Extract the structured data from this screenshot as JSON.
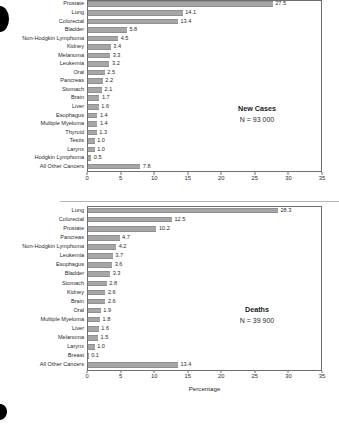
{
  "page": {
    "background_color": "#ffffff",
    "bar_color": "#a6a6a6",
    "axis_color": "#6f6f6f",
    "text_color": "#231f20"
  },
  "chart_data": [
    {
      "id": "new-cases",
      "type": "bar",
      "orientation": "horizontal",
      "title": "",
      "xlabel": "",
      "ylabel": "",
      "xlim": [
        0,
        35
      ],
      "ticks": [
        0,
        5,
        10,
        15,
        20,
        25,
        30,
        35
      ],
      "grid": false,
      "legend": "none",
      "annotation": {
        "title": "New Cases",
        "subtitle": "N = 93 000"
      },
      "categories": [
        "Prostate",
        "Lung",
        "Colorectal",
        "Bladder",
        "Non-Hodgkin Lymphoma",
        "Kidney",
        "Melanoma",
        "Leukemia",
        "Oral",
        "Pancreas",
        "Stomach",
        "Brain",
        "Liver",
        "Esophagus",
        "Multiple Myeloma",
        "Thyroid",
        "Testis",
        "Larynx",
        "Hodgkin Lymphoma",
        "All Other Cancers"
      ],
      "values": [
        27.5,
        14.1,
        13.4,
        5.8,
        4.5,
        3.4,
        3.3,
        3.2,
        2.5,
        2.2,
        2.1,
        1.7,
        1.6,
        1.4,
        1.4,
        1.3,
        1.0,
        1.0,
        0.5,
        7.8
      ],
      "value_labels": [
        "27.5",
        "14.1",
        "13.4",
        "5.8",
        "4.5",
        "3.4",
        "3.3",
        "3.2",
        "2.5",
        "2.2",
        "2.1",
        "1.7",
        "1.6",
        "1.4",
        "1.4",
        "1.3",
        "1.0",
        "1.0",
        "0.5",
        "7.8"
      ],
      "tick_labels": [
        "0",
        "5",
        "10",
        "15",
        "20",
        "25",
        "30",
        "35"
      ]
    },
    {
      "id": "deaths",
      "type": "bar",
      "orientation": "horizontal",
      "title": "",
      "xlabel": "Percentage",
      "ylabel": "",
      "xlim": [
        0,
        35
      ],
      "ticks": [
        0,
        5,
        10,
        15,
        20,
        25,
        30,
        35
      ],
      "grid": false,
      "legend": "none",
      "annotation": {
        "title": "Deaths",
        "subtitle": "N = 39 900"
      },
      "categories": [
        "Lung",
        "Colorectal",
        "Prostate",
        "Pancreas",
        "Non-Hodgkin Lymphoma",
        "Leukemia",
        "Esophagus",
        "Bladder",
        "Stomach",
        "Kidney",
        "Brain",
        "Oral",
        "Multiple Myeloma",
        "Liver",
        "Melanoma",
        "Larynx",
        "Breast",
        "All Other Cancers"
      ],
      "values": [
        28.3,
        12.5,
        10.2,
        4.7,
        4.2,
        3.7,
        3.6,
        3.3,
        2.8,
        2.6,
        2.6,
        1.9,
        1.8,
        1.6,
        1.5,
        1.0,
        0.1,
        13.4
      ],
      "value_labels": [
        "28.3",
        "12.5",
        "10.2",
        "4.7",
        "4.2",
        "3.7",
        "3.6",
        "3.3",
        "2.8",
        "2.6",
        "2.6",
        "1.9",
        "1.8",
        "1.6",
        "1.5",
        "1.0",
        "0.1",
        "13.4"
      ],
      "tick_labels": [
        "0",
        "5",
        "10",
        "15",
        "20",
        "25",
        "30",
        "35"
      ]
    }
  ]
}
